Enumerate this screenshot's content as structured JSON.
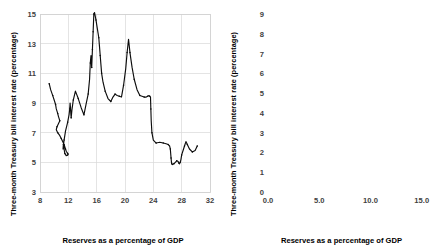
{
  "figure": {
    "axis_label_x": "Reserves as a percentage of GDP",
    "axis_label_y": "Three-month Treasury bill interest rate (percentage)",
    "line_color": "#0d0d0d",
    "grid_color": "#d9d9d9",
    "background_color": "#ffffff"
  },
  "chart_data": [
    {
      "type": "line",
      "panel": "left",
      "title": "",
      "xlabel": "Reserves as a percentage of GDP",
      "ylabel": "Three-month Treasury bill interest rate (percentage)",
      "xlim": [
        8,
        32
      ],
      "ylim": [
        3,
        15
      ],
      "xticks": [
        "8",
        "12",
        "16",
        "20",
        "24",
        "28",
        "32"
      ],
      "xtick_values": [
        8,
        12,
        16,
        20,
        24,
        28,
        32
      ],
      "yticks": [
        "3",
        "5",
        "7",
        "9",
        "11",
        "13",
        "15"
      ],
      "ytick_values": [
        3,
        5,
        7,
        9,
        11,
        13,
        15
      ],
      "grid": true,
      "legend": "none",
      "markers": true,
      "x": [
        9.3,
        9.5,
        9.8,
        10.0,
        10.2,
        10.3,
        10.5,
        10.6,
        10.8,
        10.6,
        10.4,
        10.3,
        10.5,
        10.8,
        11.0,
        11.2,
        11.4,
        11.5,
        11.6,
        11.7,
        11.9,
        12.0,
        11.9,
        11.7,
        11.5,
        11.4,
        11.3,
        11.25,
        11.4,
        11.6,
        11.9,
        12.1,
        12.2,
        12.25,
        12.3,
        12.35,
        12.4,
        12.5,
        12.7,
        13.0,
        13.4,
        13.8,
        14.2,
        14.5,
        14.8,
        15.0,
        15.1,
        15.2,
        15.3,
        15.35,
        15.4,
        15.45,
        15.5,
        15.55,
        15.6,
        15.7,
        15.9,
        16.1,
        16.3,
        16.4,
        16.5,
        16.6,
        16.7,
        16.9,
        17.2,
        17.6,
        18.0,
        18.3,
        18.6,
        18.9,
        19.2,
        19.5,
        19.8,
        20.1,
        20.3,
        20.5,
        20.7,
        21.0,
        21.3,
        21.7,
        22.1,
        22.4,
        22.7,
        23.0,
        23.2,
        23.4,
        23.5,
        23.6,
        23.65,
        23.7,
        23.8,
        24.0,
        24.4,
        24.9,
        25.4,
        25.8,
        26.1,
        26.3,
        26.4,
        26.45,
        26.5,
        26.55,
        26.6,
        26.7,
        26.9,
        27.1,
        27.3,
        27.5,
        27.6,
        27.7,
        27.8,
        27.9,
        28.0,
        28.2,
        28.4,
        28.6,
        28.8,
        29.1,
        29.5,
        29.9,
        30.2
      ],
      "y": [
        10.3,
        9.9,
        9.5,
        9.2,
        8.9,
        8.6,
        8.3,
        8.1,
        7.8,
        7.6,
        7.4,
        7.2,
        7.0,
        6.8,
        6.6,
        6.4,
        6.2,
        6.05,
        5.9,
        5.75,
        5.6,
        5.55,
        5.5,
        5.45,
        5.6,
        5.9,
        6.2,
        5.9,
        6.5,
        7.1,
        7.7,
        8.2,
        8.6,
        9.0,
        8.7,
        8.3,
        8.0,
        8.5,
        9.2,
        9.8,
        9.3,
        8.7,
        8.2,
        8.9,
        9.6,
        10.6,
        11.7,
        12.2,
        11.4,
        12.0,
        12.6,
        13.2,
        13.8,
        14.4,
        15.0,
        15.1,
        14.6,
        14.0,
        13.4,
        12.8,
        12.2,
        11.6,
        11.0,
        10.4,
        9.8,
        9.3,
        9.1,
        9.4,
        9.6,
        9.5,
        9.45,
        9.4,
        10.2,
        11.3,
        12.4,
        13.3,
        12.4,
        11.4,
        10.6,
        9.9,
        9.5,
        9.45,
        9.4,
        9.4,
        9.45,
        9.5,
        9.45,
        9.4,
        8.6,
        7.8,
        7.0,
        6.5,
        6.3,
        6.35,
        6.3,
        6.25,
        6.2,
        6.1,
        5.9,
        5.6,
        5.3,
        5.05,
        4.9,
        4.85,
        4.9,
        5.0,
        5.1,
        5.05,
        4.95,
        4.9,
        5.0,
        5.2,
        5.5,
        5.8,
        6.1,
        6.4,
        6.2,
        5.9,
        5.7,
        5.8,
        6.1,
        6.5,
        7.0,
        7.5,
        7.9,
        8.2,
        8.3,
        8.15,
        7.8,
        7.4,
        7.0,
        6.5,
        6.0,
        5.5,
        5.0,
        4.6,
        4.3,
        4.1,
        4.6,
        5.1,
        4.8,
        4.4,
        4.0,
        3.7,
        3.6,
        3.9,
        4.3,
        4.8,
        5.3,
        5.8,
        6.3,
        6.8,
        7.2,
        6.9,
        6.5,
        6.1,
        5.8,
        5.5,
        5.3,
        5.2,
        5.4,
        5.3,
        5.1,
        4.9,
        4.7,
        4.5,
        4.4,
        4.2,
        4.0,
        3.9,
        3.8,
        3.75,
        3.8
      ]
    },
    {
      "type": "line",
      "panel": "right",
      "title": "",
      "xlabel": "Reserves as a percentage of GDP",
      "ylabel": "Three-month Treasury bill interest rate (percentage)",
      "xlim": [
        0,
        16
      ],
      "ylim": [
        0,
        9
      ],
      "xticks": [
        "0.0",
        "5.0",
        "10.0",
        "15.0"
      ],
      "xtick_values": [
        0.0,
        5.0,
        10.0,
        15.0
      ],
      "yticks": [
        "0",
        "1",
        "2",
        "3",
        "4",
        "5",
        "6",
        "7",
        "8",
        "9"
      ],
      "ytick_values": [
        0,
        1,
        2,
        3,
        4,
        5,
        6,
        7,
        8,
        9
      ],
      "grid": true,
      "legend": "none",
      "markers": true,
      "x": [
        0.35,
        0.38,
        0.4,
        0.42,
        0.45,
        0.48,
        0.5,
        0.52,
        0.5,
        0.48,
        0.46,
        0.48,
        0.52,
        0.55,
        0.58,
        0.6,
        0.62,
        0.6,
        0.58,
        0.56,
        0.58,
        0.62,
        0.66,
        0.7,
        0.72,
        0.74,
        0.76,
        0.78,
        0.8,
        0.82,
        0.84,
        0.86,
        0.88,
        0.9,
        0.92,
        0.94,
        0.92,
        0.9,
        0.88,
        0.86,
        0.84,
        0.82,
        0.8,
        0.78,
        0.76,
        0.74,
        0.72,
        0.7,
        0.68,
        0.66,
        0.64,
        0.62,
        0.6,
        0.58,
        0.56,
        0.54,
        0.52,
        0.5,
        0.48,
        0.46,
        0.44,
        0.42,
        0.4,
        0.38,
        0.36,
        0.34,
        0.32,
        0.3,
        0.6,
        1.2,
        1.9,
        2.6,
        3.3,
        4.0,
        4.7,
        5.3,
        5.9,
        6.4,
        6.9,
        7.3,
        7.7,
        8.1,
        8.5,
        8.9,
        9.3,
        9.7,
        10.1,
        10.5,
        10.9,
        11.3,
        11.7,
        11.9,
        11.95,
        11.9,
        11.7,
        11.3,
        10.8,
        10.2,
        9.6,
        9.0,
        8.5,
        8.0,
        7.6,
        7.3,
        7.2,
        7.35,
        7.7,
        8.1,
        8.5,
        8.9,
        9.3,
        9.7,
        10.1,
        10.5,
        10.9,
        11.3,
        11.6,
        11.85,
        11.95,
        11.9,
        12.0,
        12.4,
        12.9,
        13.4,
        13.9,
        14.4,
        14.9,
        15.3,
        15.6,
        15.8
      ],
      "y": [
        1.05,
        1.35,
        1.6,
        1.3,
        1.0,
        1.3,
        1.7,
        2.1,
        2.6,
        3.1,
        3.6,
        4.0,
        4.35,
        4.6,
        4.8,
        5.05,
        5.3,
        5.55,
        5.8,
        6.0,
        5.7,
        5.3,
        4.95,
        4.7,
        4.8,
        4.95,
        4.85,
        4.7,
        4.55,
        4.7,
        4.9,
        5.05,
        4.9,
        4.7,
        4.55,
        4.4,
        4.25,
        4.4,
        4.6,
        4.85,
        5.0,
        4.8,
        4.55,
        4.35,
        4.55,
        4.85,
        5.1,
        5.0,
        4.8,
        4.6,
        4.4,
        4.2,
        4.0,
        3.8,
        3.6,
        3.4,
        3.2,
        3.05,
        3.6,
        4.4,
        5.3,
        6.2,
        7.0,
        7.55,
        7.8,
        8.1,
        8.4,
        7.6,
        6.4,
        5.2,
        4.2,
        3.4,
        2.8,
        2.3,
        1.95,
        1.7,
        1.55,
        1.45,
        1.4,
        1.3,
        1.2,
        1.1,
        1.0,
        0.9,
        0.8,
        0.72,
        0.64,
        0.56,
        0.48,
        0.42,
        0.38,
        0.34,
        0.3,
        0.28,
        0.26,
        0.24,
        0.22,
        0.2,
        0.19,
        0.18,
        0.17,
        0.16,
        0.15,
        0.15,
        0.16,
        0.17,
        0.18,
        0.18,
        0.19,
        0.19,
        0.2,
        0.2,
        0.21,
        0.21,
        0.22,
        0.22,
        0.22,
        0.21,
        0.2,
        0.18,
        0.16,
        0.15,
        0.14,
        0.13,
        0.12,
        0.11,
        0.1,
        0.1,
        0.09,
        0.09
      ]
    }
  ],
  "right_loop": {
    "comment": "upper loop traced clockwise in right panel",
    "x": [
      8.55,
      8.2,
      7.85,
      7.55,
      7.35,
      7.25,
      7.3,
      7.5,
      7.8,
      8.2,
      8.65,
      9.1,
      9.6,
      10.1,
      10.6,
      11.05,
      11.45,
      11.75,
      11.95,
      12.05,
      12.0,
      11.85,
      11.8,
      11.9,
      12.1,
      11.95,
      11.85,
      11.9
    ],
    "y": [
      1.2,
      1.38,
      1.58,
      1.78,
      1.98,
      2.18,
      2.32,
      2.4,
      2.44,
      2.42,
      2.36,
      2.28,
      2.18,
      2.06,
      1.92,
      1.76,
      1.58,
      1.38,
      1.16,
      0.94,
      0.74,
      0.6,
      0.5,
      0.44,
      0.4,
      0.3,
      0.22,
      0.18
    ]
  }
}
